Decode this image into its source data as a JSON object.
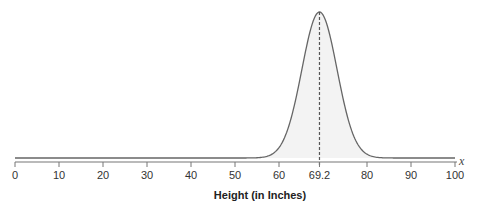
{
  "chart_data": {
    "type": "area",
    "title": "",
    "subtitle": "Normal distribution of heights",
    "xlabel": "Height (in Inches)",
    "ylabel": "",
    "variable_label": "x",
    "xlim": [
      0,
      100
    ],
    "x_ticks": [
      0,
      10,
      20,
      30,
      40,
      50,
      60,
      69.2,
      80,
      90,
      100
    ],
    "x_tick_labels": [
      "0",
      "10",
      "20",
      "30",
      "40",
      "50",
      "60",
      "69.2",
      "80",
      "90",
      "100"
    ],
    "mean": 69.2,
    "std_dev_estimate": 4,
    "mean_marker": "dashed vertical line at mean",
    "grid": false,
    "legend": "none",
    "colors": {
      "curve": "#666666",
      "fill": "#f3f3f3",
      "axis": "#777777",
      "mean_line": "#555555"
    }
  }
}
